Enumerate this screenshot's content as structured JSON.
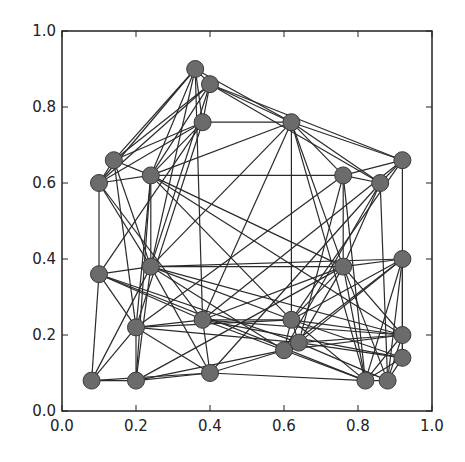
{
  "chart_data": {
    "type": "network-scatter",
    "title": "",
    "xlabel": "",
    "ylabel": "",
    "xlim": [
      0.0,
      1.0
    ],
    "ylim": [
      0.0,
      1.0
    ],
    "grid": false,
    "x_ticks": [
      "0.0",
      "0.2",
      "0.4",
      "0.6",
      "0.8",
      "1.0"
    ],
    "y_ticks": [
      "0.0",
      "0.2",
      "0.4",
      "0.6",
      "0.8",
      "1.0"
    ],
    "node_color": "#6b6b6b",
    "node_edge_color": "#3a3a3a",
    "edge_color": "#2a2a2a",
    "nodes": [
      {
        "id": 0,
        "x": 0.36,
        "y": 0.9
      },
      {
        "id": 1,
        "x": 0.4,
        "y": 0.86
      },
      {
        "id": 2,
        "x": 0.38,
        "y": 0.76
      },
      {
        "id": 3,
        "x": 0.62,
        "y": 0.76
      },
      {
        "id": 4,
        "x": 0.14,
        "y": 0.66
      },
      {
        "id": 5,
        "x": 0.1,
        "y": 0.6
      },
      {
        "id": 6,
        "x": 0.24,
        "y": 0.62
      },
      {
        "id": 7,
        "x": 0.76,
        "y": 0.62
      },
      {
        "id": 8,
        "x": 0.86,
        "y": 0.6
      },
      {
        "id": 9,
        "x": 0.92,
        "y": 0.66
      },
      {
        "id": 10,
        "x": 0.1,
        "y": 0.36
      },
      {
        "id": 11,
        "x": 0.24,
        "y": 0.38
      },
      {
        "id": 12,
        "x": 0.76,
        "y": 0.38
      },
      {
        "id": 13,
        "x": 0.92,
        "y": 0.4
      },
      {
        "id": 14,
        "x": 0.2,
        "y": 0.22
      },
      {
        "id": 15,
        "x": 0.38,
        "y": 0.24
      },
      {
        "id": 16,
        "x": 0.62,
        "y": 0.24
      },
      {
        "id": 17,
        "x": 0.64,
        "y": 0.18
      },
      {
        "id": 18,
        "x": 0.6,
        "y": 0.16
      },
      {
        "id": 19,
        "x": 0.92,
        "y": 0.2
      },
      {
        "id": 20,
        "x": 0.92,
        "y": 0.14
      },
      {
        "id": 21,
        "x": 0.08,
        "y": 0.08
      },
      {
        "id": 22,
        "x": 0.2,
        "y": 0.08
      },
      {
        "id": 23,
        "x": 0.4,
        "y": 0.1
      },
      {
        "id": 24,
        "x": 0.82,
        "y": 0.08
      },
      {
        "id": 25,
        "x": 0.88,
        "y": 0.08
      }
    ],
    "edges": [
      [
        0,
        1
      ],
      [
        0,
        2
      ],
      [
        0,
        3
      ],
      [
        0,
        4
      ],
      [
        0,
        5
      ],
      [
        0,
        6
      ],
      [
        0,
        11
      ],
      [
        0,
        15
      ],
      [
        1,
        2
      ],
      [
        1,
        3
      ],
      [
        1,
        4
      ],
      [
        1,
        5
      ],
      [
        1,
        6
      ],
      [
        1,
        9
      ],
      [
        1,
        8
      ],
      [
        1,
        11
      ],
      [
        2,
        3
      ],
      [
        2,
        4
      ],
      [
        2,
        5
      ],
      [
        2,
        6
      ],
      [
        2,
        10
      ],
      [
        2,
        14
      ],
      [
        3,
        9
      ],
      [
        3,
        7
      ],
      [
        3,
        8
      ],
      [
        3,
        16
      ],
      [
        3,
        11
      ],
      [
        3,
        6
      ],
      [
        3,
        12
      ],
      [
        3,
        15
      ],
      [
        3,
        24
      ],
      [
        4,
        5
      ],
      [
        4,
        6
      ],
      [
        4,
        11
      ],
      [
        4,
        14
      ],
      [
        5,
        6
      ],
      [
        5,
        10
      ],
      [
        5,
        11
      ],
      [
        5,
        15
      ],
      [
        6,
        7
      ],
      [
        6,
        11
      ],
      [
        6,
        14
      ],
      [
        6,
        12
      ],
      [
        6,
        16
      ],
      [
        6,
        19
      ],
      [
        6,
        22
      ],
      [
        7,
        8
      ],
      [
        7,
        9
      ],
      [
        7,
        12
      ],
      [
        7,
        14
      ],
      [
        7,
        17
      ],
      [
        7,
        24
      ],
      [
        8,
        9
      ],
      [
        8,
        12
      ],
      [
        8,
        18
      ],
      [
        8,
        23
      ],
      [
        8,
        25
      ],
      [
        9,
        13
      ],
      [
        9,
        16
      ],
      [
        9,
        15
      ],
      [
        10,
        11
      ],
      [
        10,
        21
      ],
      [
        10,
        15
      ],
      [
        10,
        17
      ],
      [
        10,
        24
      ],
      [
        10,
        14
      ],
      [
        11,
        12
      ],
      [
        11,
        22
      ],
      [
        11,
        21
      ],
      [
        11,
        16
      ],
      [
        11,
        18
      ],
      [
        11,
        19
      ],
      [
        11,
        23
      ],
      [
        11,
        13
      ],
      [
        12,
        13
      ],
      [
        12,
        16
      ],
      [
        12,
        17
      ],
      [
        12,
        19
      ],
      [
        12,
        24
      ],
      [
        12,
        25
      ],
      [
        12,
        15
      ],
      [
        12,
        22
      ],
      [
        13,
        16
      ],
      [
        13,
        17
      ],
      [
        13,
        19
      ],
      [
        13,
        20
      ],
      [
        13,
        24
      ],
      [
        13,
        25
      ],
      [
        13,
        18
      ],
      [
        14,
        15
      ],
      [
        14,
        16
      ],
      [
        14,
        17
      ],
      [
        14,
        22
      ],
      [
        14,
        21
      ],
      [
        14,
        23
      ],
      [
        15,
        16
      ],
      [
        15,
        18
      ],
      [
        15,
        19
      ],
      [
        15,
        23
      ],
      [
        15,
        20
      ],
      [
        16,
        17
      ],
      [
        16,
        18
      ],
      [
        16,
        19
      ],
      [
        16,
        20
      ],
      [
        16,
        24
      ],
      [
        17,
        18
      ],
      [
        17,
        19
      ],
      [
        17,
        20
      ],
      [
        17,
        25
      ],
      [
        18,
        23
      ],
      [
        18,
        24
      ],
      [
        18,
        19
      ],
      [
        19,
        20
      ],
      [
        19,
        24
      ],
      [
        19,
        25
      ],
      [
        20,
        24
      ],
      [
        20,
        25
      ],
      [
        21,
        22
      ],
      [
        21,
        23
      ],
      [
        22,
        23
      ],
      [
        22,
        18
      ],
      [
        23,
        24
      ],
      [
        24,
        25
      ]
    ]
  }
}
